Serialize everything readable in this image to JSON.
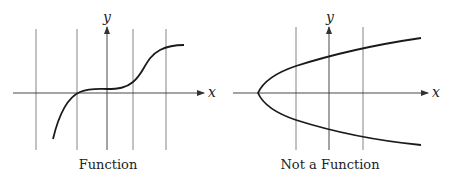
{
  "diagrams": [
    {
      "caption": "Function",
      "x_axis_label": "x",
      "y_axis_label": "y",
      "vertical_test_lines": 4
    },
    {
      "caption": "Not a Function",
      "x_axis_label": "x",
      "y_axis_label": "y",
      "vertical_test_lines": 3
    }
  ],
  "colors": {
    "curve": "#1a1a1a",
    "gridline": "#555555",
    "axis": "#333333"
  }
}
